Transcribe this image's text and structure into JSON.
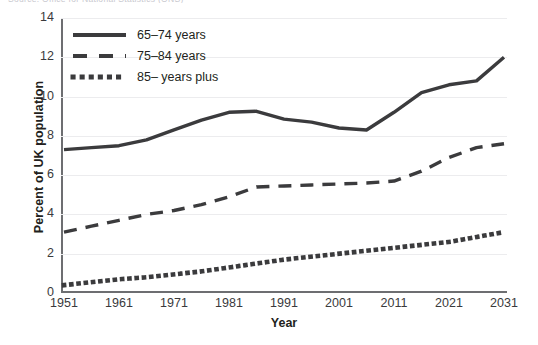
{
  "figure": {
    "top_caption_fragment": "Source: Office for National Statistics (ONS)",
    "ylabel": "Percent of UK population",
    "xlabel": "Year"
  },
  "legend": {
    "position": "top-left-inside",
    "items": [
      {
        "label": "65–74 years",
        "style": "solid",
        "icon": "solid-line-swatch",
        "color": "#3b3b3d"
      },
      {
        "label": "75–84 years",
        "style": "dashed",
        "icon": "dashed-line-swatch",
        "color": "#3b3b3d"
      },
      {
        "label": "85– years plus",
        "style": "dotted",
        "icon": "dotted-line-swatch",
        "color": "#3b3b3d"
      }
    ]
  },
  "chart_data": {
    "type": "line",
    "title": "",
    "subtitle": "",
    "xlabel": "Year",
    "ylabel": "Percent of UK population",
    "xlim": [
      1951,
      2031
    ],
    "ylim": [
      0,
      14
    ],
    "yticks": [
      0,
      2,
      4,
      6,
      8,
      10,
      12,
      14
    ],
    "ytick_labels": [
      "0",
      "2",
      "4",
      "6",
      "8",
      "10",
      "12",
      "14"
    ],
    "xticks": [
      1951,
      1961,
      1971,
      1981,
      1991,
      2001,
      2011,
      2021,
      2031
    ],
    "xtick_labels": [
      "1951",
      "1961",
      "1971",
      "1981",
      "1991",
      "2001",
      "2011",
      "2021",
      "2031"
    ],
    "grid": "horizontal",
    "x": [
      1951,
      1956,
      1961,
      1966,
      1971,
      1976,
      1981,
      1986,
      1991,
      1996,
      2001,
      2006,
      2011,
      2016,
      2021,
      2026,
      2031
    ],
    "series": [
      {
        "name": "65–74 years",
        "style": "solid",
        "color": "#3b3b3d",
        "values": [
          7.3,
          7.4,
          7.5,
          7.8,
          8.3,
          8.8,
          9.2,
          9.25,
          8.85,
          8.7,
          8.4,
          8.3,
          9.2,
          10.2,
          10.6,
          10.8,
          12.0
        ]
      },
      {
        "name": "75–84 years",
        "style": "dashed",
        "color": "#3b3b3d",
        "values": [
          3.1,
          3.4,
          3.7,
          4.0,
          4.2,
          4.5,
          4.9,
          5.4,
          5.45,
          5.5,
          5.55,
          5.6,
          5.7,
          6.2,
          6.9,
          7.4,
          7.6
        ]
      },
      {
        "name": "85– years plus",
        "style": "dotted",
        "color": "#3b3b3d",
        "values": [
          0.4,
          0.55,
          0.7,
          0.8,
          0.95,
          1.1,
          1.3,
          1.5,
          1.7,
          1.85,
          2.0,
          2.15,
          2.3,
          2.45,
          2.6,
          2.85,
          3.1
        ]
      }
    ]
  }
}
